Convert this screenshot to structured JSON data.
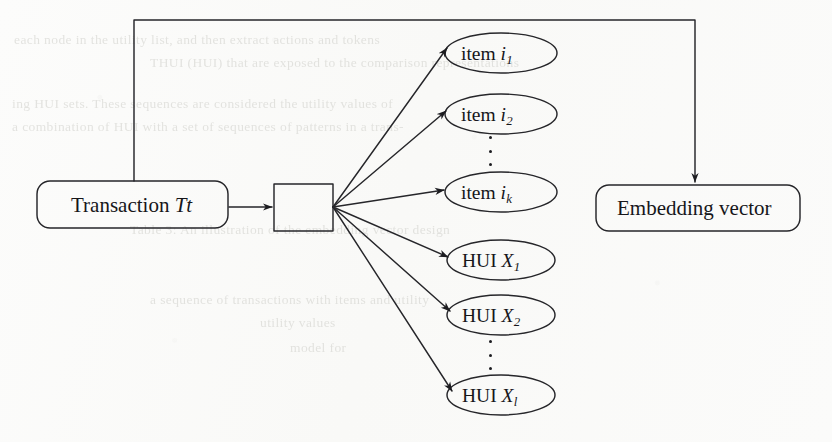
{
  "figure": {
    "kind": "flow-diagram",
    "background_color": "#fbfbfa",
    "ink_color": "#1c1c20"
  },
  "nodes": {
    "transaction": {
      "id": "transaction",
      "shape": "rounded-rectangle",
      "text_plain": "Transaction Tt",
      "text_prefix": "Transaction",
      "text_symbol": "Tt",
      "x": 37,
      "y": 181,
      "w": 191,
      "h": 47
    },
    "encoder": {
      "id": "encoder",
      "shape": "rectangle",
      "text_plain": "",
      "x": 274,
      "y": 184,
      "w": 59,
      "h": 47
    },
    "embedding": {
      "id": "embedding",
      "shape": "rounded-rectangle",
      "text_plain": "Embedding vector",
      "x": 596,
      "y": 185,
      "w": 204,
      "h": 46
    }
  },
  "ellipse_nodes": [
    {
      "id": "item-i1",
      "prefix": "item",
      "symbol": "i",
      "subscript": "1",
      "text_plain": "item i1",
      "cx": 501,
      "cy": 53,
      "rx": 56,
      "ry": 20
    },
    {
      "id": "item-i2",
      "prefix": "item",
      "symbol": "i",
      "subscript": "2",
      "text_plain": "item i2",
      "cx": 501,
      "cy": 114,
      "rx": 56,
      "ry": 20
    },
    {
      "id": "item-ik",
      "prefix": "item",
      "symbol": "i",
      "subscript": "k",
      "text_plain": "item ik",
      "cx": 501,
      "cy": 192,
      "rx": 56,
      "ry": 20
    },
    {
      "id": "hui-x1",
      "prefix": "HUI",
      "symbol": "X",
      "subscript": "1",
      "text_plain": "HUI X1",
      "cx": 501,
      "cy": 260,
      "rx": 54,
      "ry": 20
    },
    {
      "id": "hui-x2",
      "prefix": "HUI",
      "symbol": "X",
      "subscript": "2",
      "text_plain": "HUI X2",
      "cx": 501,
      "cy": 315,
      "rx": 54,
      "ry": 20
    },
    {
      "id": "hui-xl",
      "prefix": "HUI",
      "symbol": "X",
      "subscript": "l",
      "text_plain": "HUI Xl",
      "cx": 501,
      "cy": 395,
      "rx": 54,
      "ry": 20
    }
  ],
  "ellipsis_markers": [
    {
      "id": "items-ellipsis",
      "symbol": "vertical-dots",
      "x": 489,
      "y": 136,
      "dots": 3
    },
    {
      "id": "hui-ellipsis",
      "symbol": "vertical-dots",
      "x": 489,
      "y": 340,
      "dots": 3
    }
  ],
  "edges": [
    {
      "id": "transaction-to-encoder",
      "from": "transaction",
      "to": "encoder",
      "style": "straight-arrow"
    },
    {
      "id": "encoder-to-item-i1",
      "from": "encoder",
      "to": "item-i1",
      "style": "straight-arrow"
    },
    {
      "id": "encoder-to-item-i2",
      "from": "encoder",
      "to": "item-i2",
      "style": "straight-arrow"
    },
    {
      "id": "encoder-to-item-ik",
      "from": "encoder",
      "to": "item-ik",
      "style": "straight-arrow"
    },
    {
      "id": "encoder-to-hui-x1",
      "from": "encoder",
      "to": "hui-x1",
      "style": "straight-arrow"
    },
    {
      "id": "encoder-to-hui-x2",
      "from": "encoder",
      "to": "hui-x2",
      "style": "straight-arrow"
    },
    {
      "id": "encoder-to-hui-xl",
      "from": "encoder",
      "to": "hui-xl",
      "style": "straight-arrow"
    },
    {
      "id": "transaction-to-embedding-loop",
      "from": "transaction",
      "to": "embedding",
      "style": "orthogonal-arrow",
      "path": "up-right-down"
    }
  ],
  "ghost_text": [
    {
      "id": "ghost-1",
      "text": "each node in the utility list, and then extract actions and tokens",
      "x": 14,
      "y": 32,
      "size": 13.5
    },
    {
      "id": "ghost-2",
      "text": "THUI   (HUI) that are exposed to the comparison representations",
      "x": 150,
      "y": 55,
      "size": 13.5
    },
    {
      "id": "ghost-3",
      "text": "ing HUI sets. These sequences are considered the utility values of",
      "x": 12,
      "y": 96,
      "size": 13.5
    },
    {
      "id": "ghost-4",
      "text": "a combination of HUI with a set of sequences of patterns in a trans-",
      "x": 12,
      "y": 119,
      "size": 13.5
    },
    {
      "id": "ghost-5",
      "text": "Table 3: An illustration of the embedding vector design",
      "x": 130,
      "y": 222,
      "size": 13.5
    },
    {
      "id": "ghost-6",
      "text": "a sequence of transactions with items and utility",
      "x": 150,
      "y": 292,
      "size": 13.5
    },
    {
      "id": "ghost-7",
      "text": "utility values",
      "x": 260,
      "y": 315,
      "size": 13.5
    },
    {
      "id": "ghost-8",
      "text": "model for",
      "x": 290,
      "y": 340,
      "size": 13.5
    }
  ]
}
